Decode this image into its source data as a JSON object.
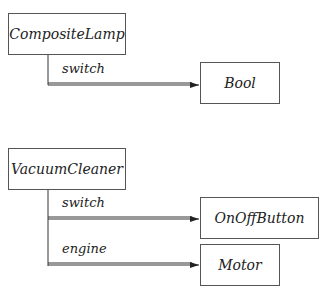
{
  "diagram": {
    "classes": [
      {
        "id": "composite-lamp",
        "label": "CompositeLamp"
      },
      {
        "id": "bool",
        "label": "Bool"
      },
      {
        "id": "vacuum-cleaner",
        "label": "VacuumCleaner"
      },
      {
        "id": "on-off-button",
        "label": "OnOffButton"
      },
      {
        "id": "motor",
        "label": "Motor"
      }
    ],
    "relations": [
      {
        "from": "CompositeLamp",
        "to": "Bool",
        "label": "switch"
      },
      {
        "from": "VacuumCleaner",
        "to": "OnOffButton",
        "label": "switch"
      },
      {
        "from": "VacuumCleaner",
        "to": "Motor",
        "label": "engine"
      }
    ],
    "line_color": "#333333"
  }
}
